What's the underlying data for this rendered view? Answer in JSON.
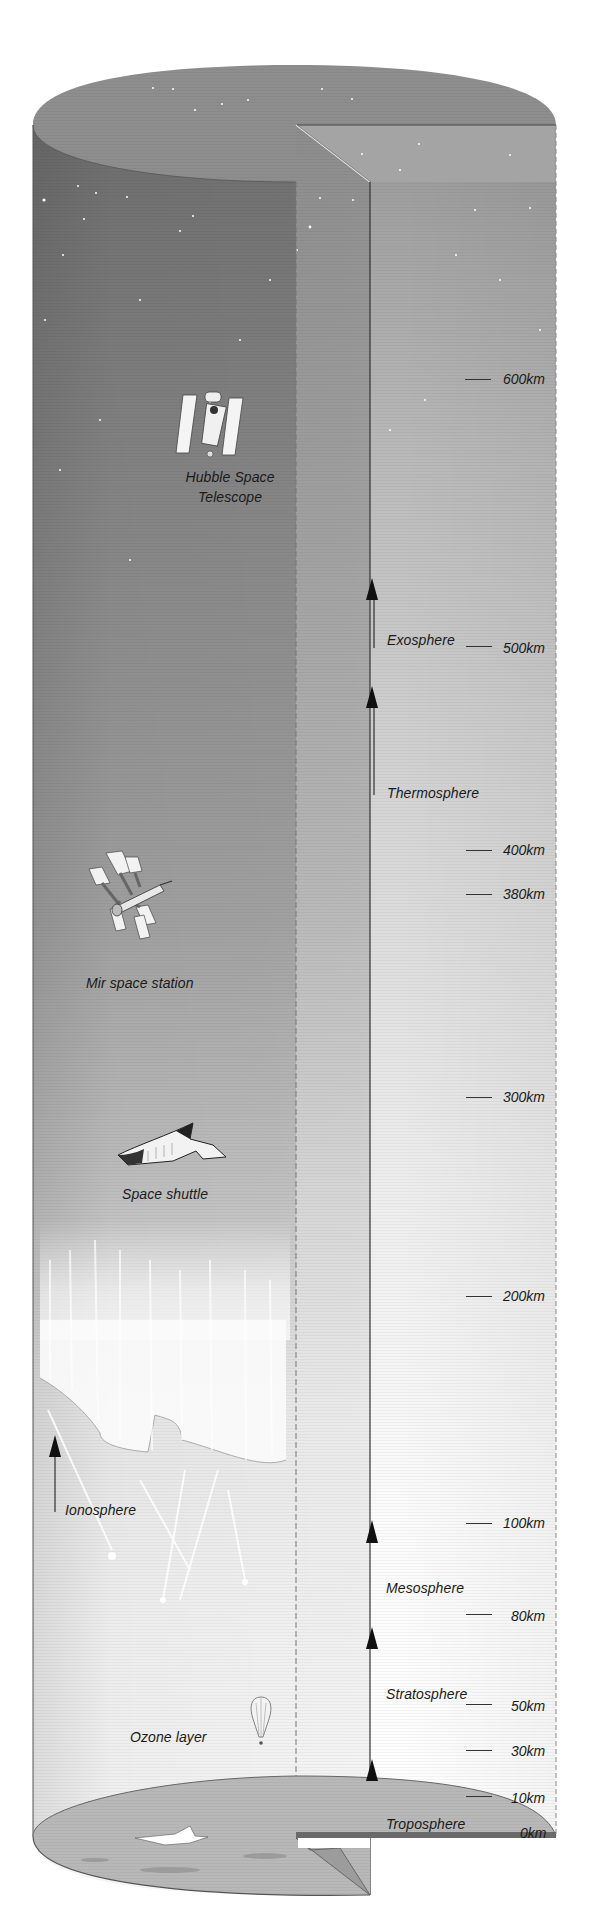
{
  "diagram": {
    "colors": {
      "space_dark": "#7a7a7a",
      "space_top": "#8f8f8f",
      "mid": "#b5b5b5",
      "light": "#e6e6e6",
      "near_ground": "#f4f4f4",
      "ground": "#b9b9b9",
      "line": "#2a2a2a"
    },
    "objects": [
      {
        "name": "Hubble Space Telescope",
        "line1": "Hubble Space",
        "line2": "Telescope"
      },
      {
        "name": "Mir space station",
        "label": "Mir space station"
      },
      {
        "name": "Space shuttle",
        "label": "Space shuttle"
      },
      {
        "name": "Ozone layer",
        "label": "Ozone layer"
      },
      {
        "name": "Ionosphere",
        "label": "Ionosphere"
      }
    ],
    "layers": [
      {
        "label": "Exosphere"
      },
      {
        "label": "Thermosphere"
      },
      {
        "label": "Mesosphere"
      },
      {
        "label": "Stratosphere"
      },
      {
        "label": "Troposphere"
      }
    ],
    "altitudes": [
      {
        "label": "600km",
        "y": 373
      },
      {
        "label": "500km",
        "y": 648
      },
      {
        "label": "400km",
        "y": 850
      },
      {
        "label": "380km",
        "y": 893
      },
      {
        "label": "300km",
        "y": 1090
      },
      {
        "label": "200km",
        "y": 1295
      },
      {
        "label": "100km",
        "y": 1523
      },
      {
        "label": "80km",
        "y": 1614
      },
      {
        "label": "50km",
        "y": 1706
      },
      {
        "label": "30km",
        "y": 1751
      },
      {
        "label": "10km",
        "y": 1799
      },
      {
        "label": "0km",
        "y": 1836
      }
    ]
  }
}
